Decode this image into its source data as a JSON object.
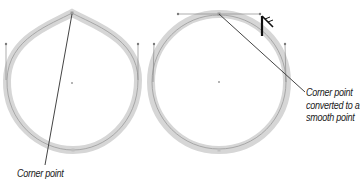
{
  "figure": {
    "left_shape": {
      "type": "teardrop-path",
      "anchor_top": "corner point",
      "callout": {
        "lines": [
          "Corner point"
        ]
      }
    },
    "right_shape": {
      "type": "circle-path",
      "anchor_top": "smooth point",
      "callout": {
        "lines": [
          "Corner point",
          "converted to a",
          "smooth point"
        ]
      }
    },
    "cursor": "pen-convert-anchor-cursor",
    "colors": {
      "stroke_halo": "#d4d4d4",
      "path_line": "#9a9a9a",
      "handle_line": "#8a8a8a",
      "leader_line": "#444444",
      "text": "#1a1a1a",
      "cursor": "#111111",
      "background": "#ffffff"
    }
  }
}
